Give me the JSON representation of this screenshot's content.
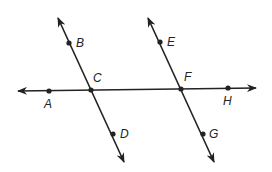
{
  "diagram": {
    "colors": {
      "line": "#222222",
      "background": "#ffffff"
    },
    "lines": [
      {
        "id": "transversal",
        "from": [
          18,
          91
        ],
        "to": [
          256,
          88
        ],
        "arrows": "both",
        "points": [
          "A",
          "C",
          "F",
          "H"
        ]
      },
      {
        "id": "line-BD",
        "from": [
          58,
          18
        ],
        "to": [
          124,
          162
        ],
        "arrows": "both",
        "points": [
          "B",
          "C",
          "D"
        ]
      },
      {
        "id": "line-EG",
        "from": [
          148,
          18
        ],
        "to": [
          214,
          162
        ],
        "arrows": "both",
        "points": [
          "E",
          "F",
          "G"
        ]
      }
    ],
    "points": [
      {
        "name": "A",
        "x": 49,
        "y": 91,
        "dot": true,
        "label_x": 44,
        "label_y": 108
      },
      {
        "name": "B",
        "x": 69,
        "y": 43,
        "dot": true,
        "label_x": 76,
        "label_y": 47
      },
      {
        "name": "C",
        "x": 91,
        "y": 90,
        "dot": true,
        "label_x": 93,
        "label_y": 82
      },
      {
        "name": "D",
        "x": 113,
        "y": 134,
        "dot": true,
        "label_x": 120,
        "label_y": 138
      },
      {
        "name": "E",
        "x": 160,
        "y": 42,
        "dot": true,
        "label_x": 167,
        "label_y": 46
      },
      {
        "name": "F",
        "x": 181,
        "y": 89,
        "dot": true,
        "label_x": 184,
        "label_y": 81
      },
      {
        "name": "G",
        "x": 203,
        "y": 134,
        "dot": true,
        "label_x": 209,
        "label_y": 138
      },
      {
        "name": "H",
        "x": 228,
        "y": 88,
        "dot": true,
        "label_x": 223,
        "label_y": 105
      }
    ]
  }
}
